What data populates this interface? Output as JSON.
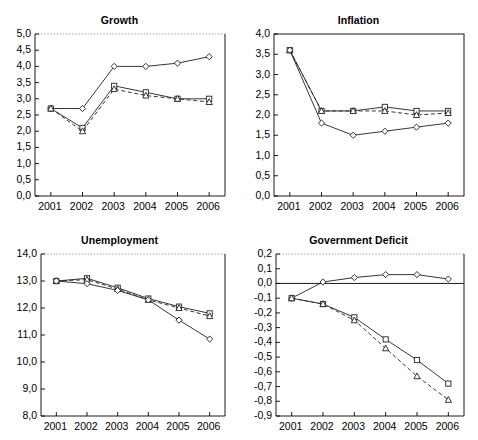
{
  "figure": {
    "panels": [
      "growth",
      "inflation",
      "unemployment",
      "deficit"
    ]
  },
  "chart_data": [
    {
      "type": "line",
      "title": "Growth",
      "xlabel": "",
      "ylabel": "",
      "x": [
        "2001",
        "2002",
        "2003",
        "2004",
        "2005",
        "2006"
      ],
      "ylim": [
        0.0,
        5.0
      ],
      "ytick_labels": [
        "0,0",
        "0,5",
        "1,0",
        "1,5",
        "2,0",
        "2,5",
        "3,0",
        "3,5",
        "4,0",
        "4,5",
        "5,0"
      ],
      "yticks": [
        0.0,
        0.5,
        1.0,
        1.5,
        2.0,
        2.5,
        3.0,
        3.5,
        4.0,
        4.5,
        5.0
      ],
      "grid": false,
      "legend": "none",
      "series": [
        {
          "name": "diamond",
          "marker": "diamond",
          "style": "solid",
          "values": [
            2.7,
            2.7,
            4.0,
            4.0,
            4.1,
            4.3
          ]
        },
        {
          "name": "square",
          "marker": "square",
          "style": "solid",
          "values": [
            2.7,
            2.1,
            3.4,
            3.2,
            3.0,
            3.0
          ]
        },
        {
          "name": "triangle",
          "marker": "triangle",
          "style": "dashed",
          "values": [
            2.7,
            2.0,
            3.3,
            3.1,
            3.0,
            2.9
          ]
        }
      ]
    },
    {
      "type": "line",
      "title": "Inflation",
      "xlabel": "",
      "ylabel": "",
      "x": [
        "2001",
        "2002",
        "2003",
        "2004",
        "2005",
        "2006"
      ],
      "ylim": [
        0.0,
        4.0
      ],
      "ytick_labels": [
        "0,0",
        "0,5",
        "1,0",
        "1,5",
        "2,0",
        "2,5",
        "3,0",
        "3,5",
        "4,0"
      ],
      "yticks": [
        0.0,
        0.5,
        1.0,
        1.5,
        2.0,
        2.5,
        3.0,
        3.5,
        4.0
      ],
      "grid": false,
      "legend": "none",
      "series": [
        {
          "name": "square",
          "marker": "square",
          "style": "solid",
          "values": [
            3.6,
            2.1,
            2.1,
            2.2,
            2.1,
            2.1
          ]
        },
        {
          "name": "triangle",
          "marker": "triangle",
          "style": "dashed",
          "values": [
            3.6,
            2.1,
            2.1,
            2.1,
            2.0,
            2.05
          ]
        },
        {
          "name": "diamond",
          "marker": "diamond",
          "style": "solid",
          "values": [
            3.6,
            1.8,
            1.5,
            1.6,
            1.7,
            1.8
          ]
        }
      ]
    },
    {
      "type": "line",
      "title": "Unemployment",
      "xlabel": "",
      "ylabel": "",
      "x": [
        "2001",
        "2002",
        "2003",
        "2004",
        "2005",
        "2006"
      ],
      "ylim": [
        8.0,
        14.0
      ],
      "ytick_labels": [
        "8,0",
        "9,0",
        "10,0",
        "11,0",
        "12,0",
        "13,0",
        "14,0"
      ],
      "yticks": [
        8.0,
        9.0,
        10.0,
        11.0,
        12.0,
        13.0,
        14.0
      ],
      "grid": false,
      "legend": "none",
      "series": [
        {
          "name": "square",
          "marker": "square",
          "style": "solid",
          "values": [
            13.0,
            13.1,
            12.75,
            12.35,
            12.05,
            11.8
          ]
        },
        {
          "name": "triangle",
          "marker": "triangle",
          "style": "dashed",
          "values": [
            13.0,
            13.05,
            12.7,
            12.3,
            12.0,
            11.7
          ]
        },
        {
          "name": "diamond",
          "marker": "diamond",
          "style": "solid",
          "values": [
            13.0,
            12.9,
            12.65,
            12.3,
            11.55,
            10.85
          ]
        }
      ]
    },
    {
      "type": "line",
      "title": "Government Deficit",
      "xlabel": "",
      "ylabel": "",
      "x": [
        "2001",
        "2002",
        "2003",
        "2004",
        "2005",
        "2006"
      ],
      "ylim": [
        -0.9,
        0.2
      ],
      "ytick_labels": [
        "-0,9",
        "-0,8",
        "-0,7",
        "-0,6",
        "-0,5",
        "-0,4",
        "-0,3",
        "-0,2",
        "-0,1",
        "0,0",
        "0,1",
        "0,2"
      ],
      "yticks": [
        -0.9,
        -0.8,
        -0.7,
        -0.6,
        -0.5,
        -0.4,
        -0.3,
        -0.2,
        -0.1,
        0.0,
        0.1,
        0.2
      ],
      "grid": false,
      "legend": "none",
      "zero_line": 0.0,
      "series": [
        {
          "name": "diamond",
          "marker": "diamond",
          "style": "solid",
          "values": [
            -0.1,
            0.01,
            0.04,
            0.06,
            0.06,
            0.03
          ]
        },
        {
          "name": "square",
          "marker": "square",
          "style": "solid",
          "values": [
            -0.1,
            -0.14,
            -0.23,
            -0.38,
            -0.52,
            -0.68
          ]
        },
        {
          "name": "triangle",
          "marker": "triangle",
          "style": "dashed",
          "values": [
            -0.1,
            -0.14,
            -0.25,
            -0.44,
            -0.63,
            -0.79
          ]
        }
      ]
    }
  ]
}
